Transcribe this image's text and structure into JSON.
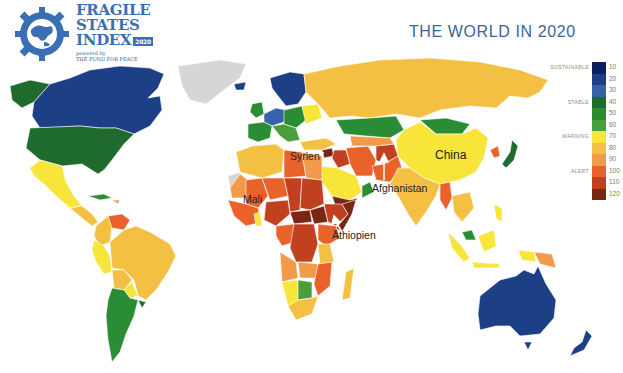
{
  "header": {
    "logo_lines": [
      "FRAGILE",
      "STATES",
      "INDEX"
    ],
    "logo_badge": "2020",
    "logo_sub1": "powered by",
    "logo_sub2": "THE FUND FOR PEACE",
    "title": "THE WORLD IN 2020"
  },
  "legend": {
    "categories": [
      {
        "label": "SUSTAINABLE",
        "row": 0
      },
      {
        "label": "STABLE",
        "row": 3
      },
      {
        "label": "WARNING",
        "row": 6
      },
      {
        "label": "ALERT",
        "row": 9
      }
    ],
    "scale": [
      {
        "value": "10",
        "color": "#0d1f5c"
      },
      {
        "value": "20",
        "color": "#1d3f86"
      },
      {
        "value": "30",
        "color": "#3562a8"
      },
      {
        "value": "40",
        "color": "#1f6b2e"
      },
      {
        "value": "50",
        "color": "#2a8c34"
      },
      {
        "value": "60",
        "color": "#4a9e3c"
      },
      {
        "value": "70",
        "color": "#f7e53a"
      },
      {
        "value": "80",
        "color": "#f4c043"
      },
      {
        "value": "90",
        "color": "#f09a4a"
      },
      {
        "value": "100",
        "color": "#e8622a"
      },
      {
        "value": "110",
        "color": "#c0401f"
      },
      {
        "value": "120",
        "color": "#7a2615"
      }
    ]
  },
  "map_labels": [
    {
      "text": "Syrien",
      "x": 290,
      "y": 154
    },
    {
      "text": "Afghanistan",
      "x": 374,
      "y": 186
    },
    {
      "text": "Äthiopien",
      "x": 332,
      "y": 232
    },
    {
      "text": "Mali",
      "x": 243,
      "y": 195
    },
    {
      "text": "China",
      "x": 435,
      "y": 151
    }
  ],
  "colors": {
    "greenland": "#d6d6d6",
    "title": "#3d6596",
    "brand": "#3a6fb5"
  }
}
